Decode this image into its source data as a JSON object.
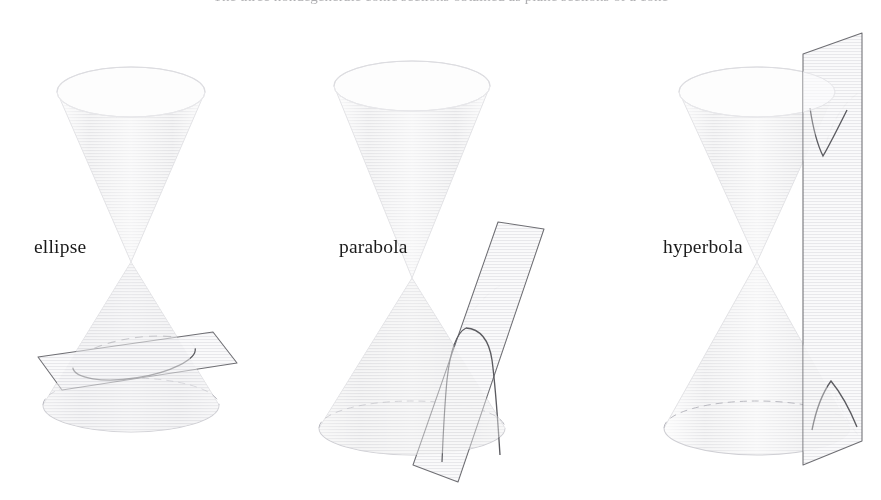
{
  "page": {
    "width": 881,
    "height": 500,
    "background": "#ffffff",
    "clipped_header_text": "The three nondegenerate conic sections obtained as plane sections of a cone",
    "figure_title": "Conic sections"
  },
  "style": {
    "cone_fill": "#f2f2f3",
    "cone_hatch": "#dedee1",
    "cone_edge": "#e2e2e5",
    "plane_fill": "#f7f7f8",
    "plane_hatch": "#e6e6e9",
    "plane_stroke": "#6e6e73",
    "curve_stroke": "#5b5b60",
    "dashed_stroke": "#9a9aa0",
    "label_color": "#1b1b1b"
  },
  "panels": [
    {
      "id": "ellipse",
      "label": "ellipse",
      "label_x": 34,
      "label_y": 253,
      "description": "A plane tilted slightly from horizontal cuts one nappe of the double cone, producing an ellipse.",
      "cone": {
        "apex_x": 131,
        "apex_y": 262,
        "top_rim_cx": 131,
        "top_rim_cy": 92,
        "top_rim_rx": 74,
        "top_rim_ry": 25,
        "bottom_rim_cx": 131,
        "bottom_rim_cy": 405,
        "bottom_rim_rx": 88,
        "bottom_rim_ry": 27,
        "upper_nappe_visible": true,
        "lower_nappe_visible": true
      },
      "plane": {
        "shape": "parallelogram",
        "points": "38,357 213,332 237,363 62,390",
        "orientation": "tilted-oblique"
      },
      "section_curve": {
        "type": "ellipse",
        "cx": 134,
        "cy": 358,
        "rx": 62,
        "ry": 20,
        "rotation_deg": -9,
        "front_visible": true,
        "back_dashed": true
      }
    },
    {
      "id": "parabola",
      "label": "parabola",
      "label_x": 339,
      "label_y": 253,
      "description": "A plane parallel to a generating line of the cone cuts one nappe, producing a parabola.",
      "cone": {
        "apex_x": 412,
        "apex_y": 278,
        "top_rim_cx": 412,
        "top_rim_cy": 86,
        "top_rim_rx": 78,
        "top_rim_ry": 25,
        "bottom_rim_cx": 412,
        "bottom_rim_cy": 428,
        "bottom_rim_rx": 93,
        "bottom_rim_ry": 27,
        "upper_nappe_visible": true,
        "lower_nappe_visible": true
      },
      "plane": {
        "shape": "rectangle",
        "points": "498,222 544,229 458,482 413,465",
        "orientation": "tilted-steep"
      },
      "section_curve": {
        "type": "parabola",
        "vertex_x": 477,
        "vertex_y": 340,
        "opens": "down-right",
        "front_visible": true,
        "back_dashed": true
      }
    },
    {
      "id": "hyperbola",
      "label": "hyperbola",
      "label_x": 663,
      "label_y": 253,
      "description": "A vertical plane cuts both nappes of the double cone, producing the two branches of a hyperbola.",
      "cone": {
        "apex_x": 757,
        "apex_y": 262,
        "top_rim_cx": 757,
        "top_rim_cy": 92,
        "top_rim_rx": 78,
        "top_rim_ry": 25,
        "bottom_rim_cx": 757,
        "bottom_rim_cy": 428,
        "bottom_rim_rx": 93,
        "bottom_rim_ry": 27,
        "upper_nappe_visible": true,
        "lower_nappe_visible": true
      },
      "plane": {
        "shape": "quadrilateral",
        "points": "862,33 862,441 803,465 803,54",
        "orientation": "vertical"
      },
      "section_curve": {
        "type": "hyperbola",
        "branches": 2,
        "upper_vertex_x": 823,
        "upper_vertex_y": 155,
        "lower_vertex_x": 831,
        "lower_vertex_y": 381,
        "front_visible": true,
        "back_dashed": true
      }
    }
  ]
}
